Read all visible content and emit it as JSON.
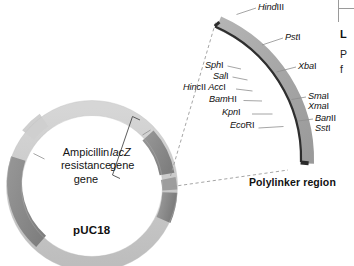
{
  "figure": {
    "plasmid_name": "pUC18",
    "polylinker_caption": "Polylinker region",
    "ampicillin_label_line1": "Ampicillin",
    "ampicillin_label_line2": "resistance",
    "ampicillin_label_line3": "gene",
    "lacz_label_gene": "lacZ",
    "lacz_label_word": "gene"
  },
  "enzymes": [
    {
      "name": "HindIII",
      "italic": "Hind",
      "roman": "III"
    },
    {
      "name": "PstI",
      "italic": "Pst",
      "roman": "I"
    },
    {
      "name": "XbaI",
      "italic": "Xba",
      "roman": "I"
    },
    {
      "name": "SphI",
      "italic": "Sph",
      "roman": "I"
    },
    {
      "name": "SalI",
      "italic": "Sal",
      "roman": "I"
    },
    {
      "name": "HincII",
      "italic": "Hinc",
      "roman": "II"
    },
    {
      "name": "AccI",
      "italic": "Acc",
      "roman": "I"
    },
    {
      "name": "BamHI",
      "italic": "Bam",
      "roman": "HI"
    },
    {
      "name": "KpnI",
      "italic": "Kpn",
      "roman": "I"
    },
    {
      "name": "EcoRI",
      "italic": "Eco",
      "roman": "RI"
    },
    {
      "name": "SmaI",
      "italic": "Sma",
      "roman": "I"
    },
    {
      "name": "XmaI",
      "italic": "Xma",
      "roman": "I"
    },
    {
      "name": "BanII",
      "italic": "Ban",
      "roman": "II"
    },
    {
      "name": "SstI",
      "italic": "Sst",
      "roman": "I"
    }
  ],
  "side_panel": {
    "heading_fragment": "L",
    "body_fragment_1": "P",
    "body_fragment_2": "f"
  },
  "colors": {
    "segment_light": "#c9c9c9",
    "segment_dark": "#8a8a8a",
    "segment_medium": "#a3a3a3",
    "arc_fill": "#a8a8a8",
    "arc_edge": "#2b2b2b",
    "leader": "#8e8e8e",
    "dashed": "#9b9b9b",
    "text": "#141414",
    "background": "#ffffff"
  }
}
